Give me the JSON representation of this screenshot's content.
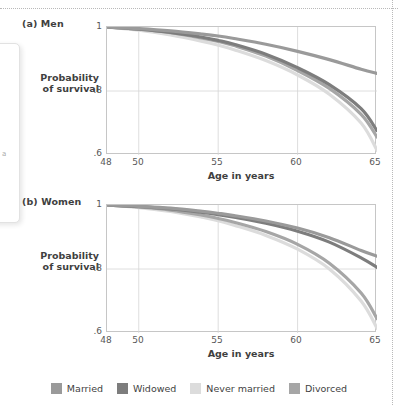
{
  "figure": {
    "y_axis_label_line1": "Probability",
    "y_axis_label_line2": "of survival",
    "x_axis_label": "Age in years"
  },
  "panels": [
    {
      "id": "men",
      "title": "(a) Men"
    },
    {
      "id": "women",
      "title": "(b) Women"
    }
  ],
  "legend": {
    "items": [
      {
        "label": "Married",
        "color": "#9a9a9a"
      },
      {
        "label": "Widowed",
        "color": "#7d7d7d"
      },
      {
        "label": "Never married",
        "color": "#dcdcdc"
      },
      {
        "label": "Divorced",
        "color": "#a6a6a6"
      }
    ]
  },
  "axes": {
    "y_ticks": [
      "1",
      ".8",
      ".6"
    ],
    "y_tick_values": [
      1,
      0.8,
      0.6
    ],
    "x_ticks": [
      "48",
      "50",
      "55",
      "60",
      "65"
    ],
    "x_tick_values": [
      48,
      50,
      55,
      60,
      65
    ],
    "xlim": [
      48,
      65
    ],
    "ylim": [
      0.6,
      1.0
    ]
  },
  "chart_data": {
    "type": "line",
    "xlabel": "Age in years",
    "ylabel": "Probability of survival",
    "xlim": [
      48,
      65
    ],
    "ylim": [
      0.6,
      1.0
    ],
    "x": [
      48,
      50,
      52,
      54,
      55,
      56,
      58,
      60,
      62,
      64,
      65
    ],
    "grid": true,
    "legend_position": "bottom",
    "panels": [
      {
        "panel": "(a) Men",
        "series": [
          {
            "name": "Married",
            "color": "#9a9a9a",
            "values": [
              1.0,
              0.995,
              0.988,
              0.978,
              0.972,
              0.964,
              0.946,
              0.924,
              0.898,
              0.868,
              0.855
            ]
          },
          {
            "name": "Widowed",
            "color": "#7d7d7d",
            "values": [
              1.0,
              0.993,
              0.983,
              0.968,
              0.958,
              0.946,
              0.915,
              0.873,
              0.82,
              0.745,
              0.676
            ]
          },
          {
            "name": "Divorced",
            "color": "#a6a6a6",
            "values": [
              1.0,
              0.993,
              0.982,
              0.965,
              0.955,
              0.942,
              0.909,
              0.864,
              0.808,
              0.727,
              0.656
            ]
          },
          {
            "name": "Never married",
            "color": "#dcdcdc",
            "values": [
              1.0,
              0.99,
              0.975,
              0.955,
              0.943,
              0.929,
              0.895,
              0.85,
              0.79,
              0.7,
              0.615
            ]
          }
        ]
      },
      {
        "panel": "(b) Women",
        "series": [
          {
            "name": "Married",
            "color": "#9a9a9a",
            "values": [
              1.0,
              0.996,
              0.99,
              0.98,
              0.974,
              0.967,
              0.95,
              0.928,
              0.898,
              0.858,
              0.84
            ]
          },
          {
            "name": "Widowed",
            "color": "#7d7d7d",
            "values": [
              1.0,
              0.995,
              0.988,
              0.977,
              0.97,
              0.962,
              0.943,
              0.918,
              0.884,
              0.835,
              0.805
            ]
          },
          {
            "name": "Divorced",
            "color": "#a6a6a6",
            "values": [
              1.0,
              0.994,
              0.984,
              0.968,
              0.958,
              0.946,
              0.917,
              0.877,
              0.818,
              0.725,
              0.645
            ]
          },
          {
            "name": "Never married",
            "color": "#dcdcdc",
            "values": [
              1.0,
              0.992,
              0.98,
              0.962,
              0.951,
              0.937,
              0.905,
              0.862,
              0.8,
              0.7,
              0.615
            ]
          }
        ]
      }
    ]
  }
}
